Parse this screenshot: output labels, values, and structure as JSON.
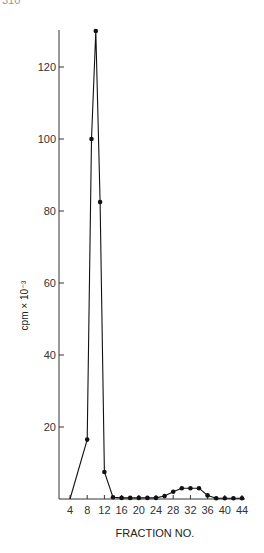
{
  "page": {
    "number": "310"
  },
  "chart_data": {
    "type": "line",
    "title": "",
    "xlabel": "FRACTION NO.",
    "ylabel": "cpm × 10⁻³",
    "xlim": [
      2,
      46
    ],
    "ylim": [
      0,
      130
    ],
    "x_ticks": [
      4,
      8,
      12,
      16,
      20,
      24,
      28,
      32,
      36,
      40,
      44
    ],
    "y_ticks": [
      20,
      40,
      60,
      80,
      100,
      120
    ],
    "grid": false,
    "legend": null,
    "series": [
      {
        "name": "cpm",
        "color": "#111111",
        "x": [
          4,
          8,
          9,
          10,
          11,
          12,
          14,
          16,
          18,
          20,
          22,
          24,
          26,
          28,
          30,
          32,
          34,
          36,
          38,
          40,
          42,
          44
        ],
        "values": [
          0,
          16.5,
          100,
          130,
          82.5,
          7.5,
          0.5,
          0.3,
          0.3,
          0.3,
          0.3,
          0.3,
          0.8,
          2,
          3,
          3,
          3,
          1,
          0.2,
          0.2,
          0.2,
          0.2
        ],
        "markers": [
          false,
          true,
          true,
          true,
          true,
          true,
          true,
          true,
          true,
          true,
          true,
          true,
          true,
          true,
          true,
          true,
          true,
          true,
          true,
          true,
          true,
          true
        ]
      }
    ]
  }
}
